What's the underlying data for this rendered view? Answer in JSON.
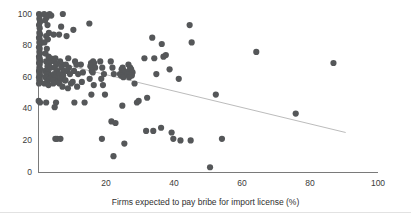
{
  "chart_data": {
    "type": "scatter",
    "title": "",
    "subtitle": "",
    "xlabel": "Firms expected to pay bribe for import license (%)",
    "ylabel": "",
    "xlim": [
      0,
      100
    ],
    "ylim": [
      0,
      100
    ],
    "xticks": [
      0,
      20,
      40,
      60,
      80,
      100
    ],
    "xtick_labels": [
      "",
      "20",
      "40",
      "60",
      "80",
      "100"
    ],
    "yticks": [
      0,
      20,
      40,
      60,
      80,
      100
    ],
    "ytick_labels": [
      "0",
      "20",
      "40",
      "60",
      "80",
      "100"
    ],
    "grid": false,
    "legend": false,
    "legend_position": "none",
    "marker_color": "#555759",
    "marker_size": 3.1,
    "trendline": {
      "type": "linear",
      "color": "#bcbcbc",
      "width": 1,
      "x_start": 0.0,
      "y_start": 72.0,
      "x_end": 90.5,
      "y_end": 25.0,
      "slope": -0.519,
      "intercept": 72.0
    },
    "points": [
      [
        0.3,
        100
      ],
      [
        0.5,
        99
      ],
      [
        0.4,
        97
      ],
      [
        0.6,
        95
      ],
      [
        0.3,
        93
      ],
      [
        0.5,
        91
      ],
      [
        0.4,
        88
      ],
      [
        0.6,
        87
      ],
      [
        0.3,
        85
      ],
      [
        0.5,
        84
      ],
      [
        0.4,
        82
      ],
      [
        0.6,
        81
      ],
      [
        0.3,
        79
      ],
      [
        0.5,
        78
      ],
      [
        0.4,
        76
      ],
      [
        0.6,
        75
      ],
      [
        0.3,
        73
      ],
      [
        0.5,
        72
      ],
      [
        0.4,
        71
      ],
      [
        0.6,
        70
      ],
      [
        0.3,
        69
      ],
      [
        0.5,
        68
      ],
      [
        0.4,
        66
      ],
      [
        0.6,
        65
      ],
      [
        0.3,
        64
      ],
      [
        0.5,
        63
      ],
      [
        0.4,
        62
      ],
      [
        0.6,
        61
      ],
      [
        0.3,
        60
      ],
      [
        0.5,
        59
      ],
      [
        0.4,
        58
      ],
      [
        0.6,
        57
      ],
      [
        0.3,
        56
      ],
      [
        0.2,
        45
      ],
      [
        0.6,
        44
      ],
      [
        1.8,
        100
      ],
      [
        2.3,
        99
      ],
      [
        2.6,
        98
      ],
      [
        2.1,
        96
      ],
      [
        2.8,
        93
      ],
      [
        3.4,
        100
      ],
      [
        3.9,
        99
      ],
      [
        3.2,
        88
      ],
      [
        2.4,
        86
      ],
      [
        2.9,
        84
      ],
      [
        1.9,
        82
      ],
      [
        2.6,
        78
      ],
      [
        2.2,
        75
      ],
      [
        3.1,
        73
      ],
      [
        3.7,
        72
      ],
      [
        2.4,
        70
      ],
      [
        3.3,
        69
      ],
      [
        2.8,
        67
      ],
      [
        3.6,
        66
      ],
      [
        2.1,
        64
      ],
      [
        3.0,
        63
      ],
      [
        2.5,
        62
      ],
      [
        3.8,
        61
      ],
      [
        2.2,
        60
      ],
      [
        3.4,
        59
      ],
      [
        2.7,
        57
      ],
      [
        1.9,
        56
      ],
      [
        3.1,
        55
      ],
      [
        2.4,
        44
      ],
      [
        4.6,
        87
      ],
      [
        5.1,
        72
      ],
      [
        4.8,
        70
      ],
      [
        5.4,
        68
      ],
      [
        4.9,
        66
      ],
      [
        5.6,
        64
      ],
      [
        4.7,
        62
      ],
      [
        5.2,
        60
      ],
      [
        4.4,
        58
      ],
      [
        5.8,
        57
      ],
      [
        4.5,
        56
      ],
      [
        5.3,
        44
      ],
      [
        4.9,
        41
      ],
      [
        5.1,
        21
      ],
      [
        5.6,
        21
      ],
      [
        6.2,
        87
      ],
      [
        6.8,
        92
      ],
      [
        7.3,
        100
      ],
      [
        6.5,
        70
      ],
      [
        7.1,
        68
      ],
      [
        6.9,
        66
      ],
      [
        7.6,
        64
      ],
      [
        6.4,
        62
      ],
      [
        7.4,
        61
      ],
      [
        6.7,
        59
      ],
      [
        7.9,
        58
      ],
      [
        6.3,
        56
      ],
      [
        7.2,
        54
      ],
      [
        6.6,
        21
      ],
      [
        8.4,
        86
      ],
      [
        8.9,
        72
      ],
      [
        8.2,
        68
      ],
      [
        9.1,
        66
      ],
      [
        8.6,
        64
      ],
      [
        9.4,
        62
      ],
      [
        8.1,
        58
      ],
      [
        9.7,
        56
      ],
      [
        8.8,
        53
      ],
      [
        10.4,
        90
      ],
      [
        10.9,
        70
      ],
      [
        11.3,
        68
      ],
      [
        10.6,
        64
      ],
      [
        11.8,
        62
      ],
      [
        10.2,
        57
      ],
      [
        11.5,
        54
      ],
      [
        10.7,
        44
      ],
      [
        12.6,
        68
      ],
      [
        13.2,
        63
      ],
      [
        12.9,
        57
      ],
      [
        13.7,
        44
      ],
      [
        15.1,
        94
      ],
      [
        15.6,
        69
      ],
      [
        15.9,
        68
      ],
      [
        16.2,
        70
      ],
      [
        16.5,
        69
      ],
      [
        15.4,
        67
      ],
      [
        16.8,
        66
      ],
      [
        15.8,
        64
      ],
      [
        16.1,
        63
      ],
      [
        15.2,
        59
      ],
      [
        16.4,
        55
      ],
      [
        15.7,
        49
      ],
      [
        18.3,
        70
      ],
      [
        18.9,
        66
      ],
      [
        19.4,
        62
      ],
      [
        18.6,
        59
      ],
      [
        19.1,
        55
      ],
      [
        19.7,
        49
      ],
      [
        18.8,
        21
      ],
      [
        21.4,
        70
      ],
      [
        21.9,
        66
      ],
      [
        22.3,
        62
      ],
      [
        21.6,
        32
      ],
      [
        22.8,
        31
      ],
      [
        22.2,
        10
      ],
      [
        24.1,
        62
      ],
      [
        24.6,
        65
      ],
      [
        24.9,
        66
      ],
      [
        25.3,
        64
      ],
      [
        25.7,
        63
      ],
      [
        24.4,
        61
      ],
      [
        25.1,
        60
      ],
      [
        24.8,
        42
      ],
      [
        25.4,
        18
      ],
      [
        26.6,
        68
      ],
      [
        27.1,
        66
      ],
      [
        27.4,
        65
      ],
      [
        26.9,
        64
      ],
      [
        27.8,
        63
      ],
      [
        26.3,
        62
      ],
      [
        27.6,
        61
      ],
      [
        26.8,
        60
      ],
      [
        28.4,
        56
      ],
      [
        29.1,
        44
      ],
      [
        29.6,
        45
      ],
      [
        31.3,
        72
      ],
      [
        32.1,
        47
      ],
      [
        31.8,
        26
      ],
      [
        33.6,
        85
      ],
      [
        34.2,
        72
      ],
      [
        34.8,
        62
      ],
      [
        33.9,
        26
      ],
      [
        36.4,
        81
      ],
      [
        36.9,
        73
      ],
      [
        37.6,
        74
      ],
      [
        36.2,
        28
      ],
      [
        38.7,
        65
      ],
      [
        39.3,
        25
      ],
      [
        39.8,
        21
      ],
      [
        41.4,
        59
      ],
      [
        41.9,
        20
      ],
      [
        44.6,
        93
      ],
      [
        45.2,
        82
      ],
      [
        44.9,
        20
      ],
      [
        50.6,
        3
      ],
      [
        52.3,
        49
      ],
      [
        54.1,
        21
      ],
      [
        64.2,
        76
      ],
      [
        75.8,
        37
      ],
      [
        86.9,
        69
      ]
    ]
  }
}
